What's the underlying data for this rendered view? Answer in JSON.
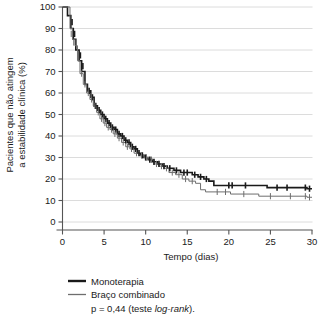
{
  "chart_data": {
    "type": "line",
    "title": "",
    "xlabel": "Tempo (dias)",
    "ylabel": "Pacientes que não atingem a estabilidade clínica (%)",
    "ylabel_line1": "Pacientes que não atingem",
    "ylabel_line2": "a estabilidade clínica (%)",
    "xlim": [
      0,
      30
    ],
    "ylim": [
      0,
      100
    ],
    "xticks": [
      0,
      5,
      10,
      15,
      20,
      25,
      30
    ],
    "yticks": [
      0,
      10,
      20,
      30,
      40,
      50,
      60,
      70,
      80,
      90,
      100
    ],
    "grid": "horizontal",
    "legend_position": "below-plot-left",
    "annotation": "p = 0,44 (teste log-rank).",
    "annotation_prefix": "p = 0,44 (teste ",
    "annotation_italic": "log-rank",
    "annotation_suffix": ").",
    "series": [
      {
        "name": "Monoterapia",
        "color": "#1a1a1a",
        "width": 1.6,
        "steps": [
          [
            0.0,
            100
          ],
          [
            0.6,
            100
          ],
          [
            0.6,
            96
          ],
          [
            1.0,
            96
          ],
          [
            1.0,
            90
          ],
          [
            1.3,
            90
          ],
          [
            1.3,
            85
          ],
          [
            1.6,
            85
          ],
          [
            1.6,
            80
          ],
          [
            1.9,
            80
          ],
          [
            2.0,
            80
          ],
          [
            2.0,
            75
          ],
          [
            2.3,
            75
          ],
          [
            2.3,
            70
          ],
          [
            2.6,
            70
          ],
          [
            2.7,
            70
          ],
          [
            2.7,
            64
          ],
          [
            3.0,
            64
          ],
          [
            3.0,
            61
          ],
          [
            3.4,
            61
          ],
          [
            3.4,
            58
          ],
          [
            3.8,
            58
          ],
          [
            3.8,
            54
          ],
          [
            4.2,
            54
          ],
          [
            4.2,
            52
          ],
          [
            4.6,
            52
          ],
          [
            4.6,
            50
          ],
          [
            5.0,
            50
          ],
          [
            5.0,
            48
          ],
          [
            5.4,
            48
          ],
          [
            5.4,
            46
          ],
          [
            5.8,
            46
          ],
          [
            5.8,
            44
          ],
          [
            6.2,
            44
          ],
          [
            6.2,
            43
          ],
          [
            6.6,
            43
          ],
          [
            6.6,
            41
          ],
          [
            7.0,
            41
          ],
          [
            7.0,
            40
          ],
          [
            7.4,
            40
          ],
          [
            7.4,
            38
          ],
          [
            7.8,
            38
          ],
          [
            7.8,
            37
          ],
          [
            8.2,
            37
          ],
          [
            8.2,
            35
          ],
          [
            8.6,
            35
          ],
          [
            8.6,
            34
          ],
          [
            9.0,
            34
          ],
          [
            9.0,
            32
          ],
          [
            9.4,
            32
          ],
          [
            9.4,
            31
          ],
          [
            9.8,
            31
          ],
          [
            9.8,
            30
          ],
          [
            10.3,
            30
          ],
          [
            10.3,
            29
          ],
          [
            10.8,
            29
          ],
          [
            10.8,
            28
          ],
          [
            11.4,
            28
          ],
          [
            11.4,
            27
          ],
          [
            12.0,
            27
          ],
          [
            12.0,
            26
          ],
          [
            12.6,
            26
          ],
          [
            12.6,
            25
          ],
          [
            13.4,
            25
          ],
          [
            13.4,
            24
          ],
          [
            14.2,
            24
          ],
          [
            14.2,
            23
          ],
          [
            15.6,
            23
          ],
          [
            15.6,
            22
          ],
          [
            16.3,
            22
          ],
          [
            16.3,
            21
          ],
          [
            17.0,
            21
          ],
          [
            17.0,
            20
          ],
          [
            17.6,
            20
          ],
          [
            17.6,
            19
          ],
          [
            18.2,
            19
          ],
          [
            18.2,
            17
          ],
          [
            24.6,
            17
          ],
          [
            24.6,
            16
          ],
          [
            29.4,
            16
          ],
          [
            29.4,
            15.5
          ],
          [
            30.0,
            15.5
          ]
        ],
        "censors": [
          [
            1.15,
            93
          ],
          [
            1.45,
            87.5
          ],
          [
            2.15,
            77.5
          ],
          [
            2.45,
            72.5
          ],
          [
            3.2,
            61
          ],
          [
            3.6,
            58
          ],
          [
            4.0,
            54
          ],
          [
            4.4,
            52
          ],
          [
            4.8,
            50
          ],
          [
            5.2,
            48
          ],
          [
            5.6,
            46
          ],
          [
            6.0,
            44
          ],
          [
            6.4,
            43
          ],
          [
            6.8,
            41
          ],
          [
            7.2,
            40
          ],
          [
            7.6,
            38
          ],
          [
            8.0,
            37
          ],
          [
            8.4,
            35
          ],
          [
            8.8,
            34
          ],
          [
            9.2,
            32
          ],
          [
            9.6,
            31
          ],
          [
            10.0,
            30
          ],
          [
            10.5,
            29
          ],
          [
            11.0,
            28
          ],
          [
            11.6,
            27
          ],
          [
            12.2,
            26
          ],
          [
            12.9,
            25
          ],
          [
            13.7,
            24
          ],
          [
            14.6,
            23
          ],
          [
            15.0,
            23
          ],
          [
            15.9,
            22
          ],
          [
            16.6,
            21
          ],
          [
            17.3,
            20
          ],
          [
            20.0,
            17
          ],
          [
            20.4,
            17
          ],
          [
            22.0,
            17
          ],
          [
            25.8,
            16
          ],
          [
            27.0,
            16
          ],
          [
            29.2,
            16
          ],
          [
            29.7,
            15.5
          ]
        ]
      },
      {
        "name": "Braço combinado",
        "color": "#6e6e6e",
        "width": 1.0,
        "steps": [
          [
            0.0,
            100
          ],
          [
            0.9,
            100
          ],
          [
            0.9,
            90
          ],
          [
            1.2,
            90
          ],
          [
            1.2,
            85
          ],
          [
            1.5,
            85
          ],
          [
            1.5,
            82
          ],
          [
            1.8,
            82
          ],
          [
            1.8,
            75
          ],
          [
            2.1,
            75
          ],
          [
            2.1,
            69
          ],
          [
            2.5,
            69
          ],
          [
            2.5,
            64
          ],
          [
            2.9,
            64
          ],
          [
            2.9,
            60
          ],
          [
            3.3,
            60
          ],
          [
            3.3,
            57
          ],
          [
            3.7,
            57
          ],
          [
            3.7,
            54
          ],
          [
            4.1,
            54
          ],
          [
            4.1,
            51
          ],
          [
            4.5,
            51
          ],
          [
            4.5,
            48
          ],
          [
            4.9,
            48
          ],
          [
            4.9,
            46
          ],
          [
            5.3,
            46
          ],
          [
            5.3,
            44
          ],
          [
            5.7,
            44
          ],
          [
            5.7,
            43
          ],
          [
            6.1,
            43
          ],
          [
            6.1,
            41
          ],
          [
            6.6,
            41
          ],
          [
            6.6,
            39
          ],
          [
            7.1,
            39
          ],
          [
            7.1,
            37
          ],
          [
            7.6,
            37
          ],
          [
            7.6,
            35
          ],
          [
            8.1,
            35
          ],
          [
            8.1,
            34
          ],
          [
            8.6,
            34
          ],
          [
            8.6,
            32
          ],
          [
            9.2,
            32
          ],
          [
            9.2,
            31
          ],
          [
            9.8,
            31
          ],
          [
            9.8,
            30
          ],
          [
            10.4,
            30
          ],
          [
            10.4,
            29
          ],
          [
            11.0,
            29
          ],
          [
            11.0,
            27
          ],
          [
            11.6,
            27
          ],
          [
            11.6,
            26
          ],
          [
            12.2,
            26
          ],
          [
            12.2,
            25
          ],
          [
            12.8,
            25
          ],
          [
            12.8,
            23
          ],
          [
            13.6,
            23
          ],
          [
            13.6,
            22
          ],
          [
            14.4,
            22
          ],
          [
            14.4,
            20
          ],
          [
            15.2,
            20
          ],
          [
            15.2,
            19
          ],
          [
            16.0,
            19
          ],
          [
            16.0,
            18
          ],
          [
            16.6,
            18
          ],
          [
            16.6,
            15
          ],
          [
            17.2,
            15
          ],
          [
            17.2,
            14
          ],
          [
            20.2,
            14
          ],
          [
            20.2,
            13
          ],
          [
            23.6,
            13
          ],
          [
            23.6,
            12
          ],
          [
            29.4,
            12
          ],
          [
            29.4,
            11.5
          ],
          [
            30.0,
            11.5
          ]
        ],
        "censors": [
          [
            1.05,
            87.5
          ],
          [
            1.35,
            83.5
          ],
          [
            2.3,
            69
          ],
          [
            2.7,
            64
          ],
          [
            3.1,
            60
          ],
          [
            3.5,
            57
          ],
          [
            3.9,
            54
          ],
          [
            4.3,
            51
          ],
          [
            4.7,
            48
          ],
          [
            5.1,
            46
          ],
          [
            5.5,
            44
          ],
          [
            5.9,
            43
          ],
          [
            6.3,
            41
          ],
          [
            6.8,
            39
          ],
          [
            7.3,
            37
          ],
          [
            7.8,
            35
          ],
          [
            8.3,
            34
          ],
          [
            8.9,
            32
          ],
          [
            9.5,
            31
          ],
          [
            10.1,
            30
          ],
          [
            10.7,
            29
          ],
          [
            11.3,
            27
          ],
          [
            11.9,
            26
          ],
          [
            12.5,
            25
          ],
          [
            13.2,
            23
          ],
          [
            14.0,
            22
          ],
          [
            14.8,
            20
          ],
          [
            15.6,
            19
          ],
          [
            18.6,
            14
          ],
          [
            19.6,
            14
          ],
          [
            21.8,
            13
          ],
          [
            25.0,
            12
          ],
          [
            27.4,
            12
          ],
          [
            29.2,
            12
          ],
          [
            29.7,
            11.5
          ]
        ]
      }
    ]
  },
  "legend": {
    "items": [
      {
        "label": "Monoterapia",
        "color": "#1a1a1a",
        "width": 2.4
      },
      {
        "label": "Braço combinado",
        "color": "#6e6e6e",
        "width": 1.3
      }
    ]
  }
}
